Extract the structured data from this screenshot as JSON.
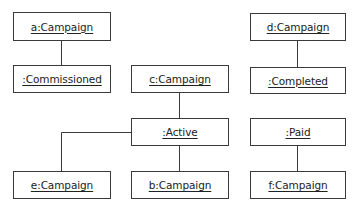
{
  "diagram": {
    "type": "UML object/state diagram",
    "nodes": [
      {
        "id": "a",
        "label": "a:Campaign"
      },
      {
        "id": "commissioned",
        "label": ":Commissioned"
      },
      {
        "id": "c",
        "label": "c:Campaign"
      },
      {
        "id": "active",
        "label": ":Active"
      },
      {
        "id": "e",
        "label": "e:Campaign"
      },
      {
        "id": "b",
        "label": "b:Campaign"
      },
      {
        "id": "d",
        "label": "d:Campaign"
      },
      {
        "id": "completed",
        "label": ":Completed"
      },
      {
        "id": "paid",
        "label": ":Paid"
      },
      {
        "id": "f",
        "label": "f:Campaign"
      }
    ],
    "links": [
      {
        "from": "a:Campaign",
        "to": ":Commissioned"
      },
      {
        "from": "c:Campaign",
        "to": ":Active"
      },
      {
        "from": ":Active",
        "to": "e:Campaign"
      },
      {
        "from": ":Active",
        "to": "b:Campaign"
      },
      {
        "from": "d:Campaign",
        "to": ":Completed"
      },
      {
        "from": ":Paid",
        "to": "f:Campaign"
      }
    ],
    "colors": {
      "stroke": "#3a3a3a",
      "text": "#222222",
      "background": "#ffffff"
    }
  }
}
